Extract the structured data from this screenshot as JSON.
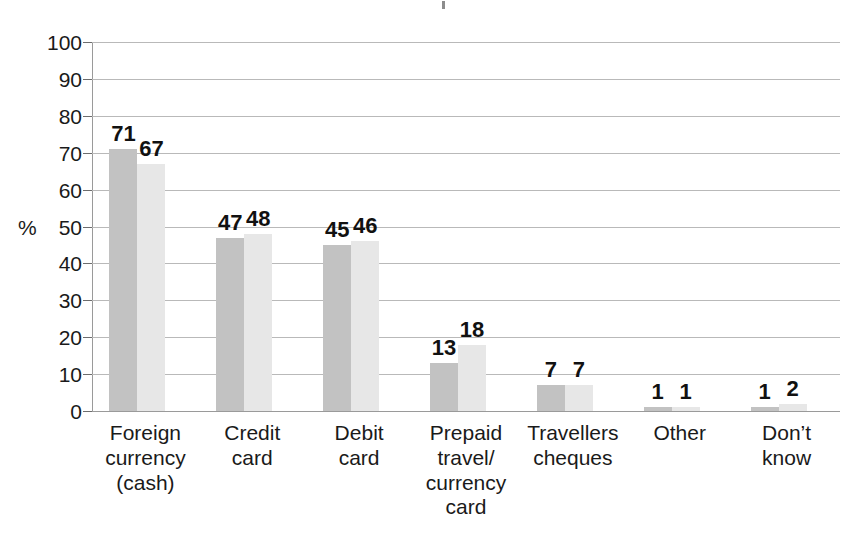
{
  "chart_data": {
    "type": "bar",
    "title": "",
    "xlabel": "",
    "ylabel": "%",
    "ylim": [
      0,
      100
    ],
    "ytick_step": 10,
    "yticks": [
      0,
      10,
      20,
      30,
      40,
      50,
      60,
      70,
      80,
      90,
      100
    ],
    "ytick_labels": [
      "0",
      "10",
      "20",
      "30",
      "40",
      "50",
      "60",
      "70",
      "80",
      "90",
      "100"
    ],
    "grid": true,
    "legend": "none",
    "categories": [
      "Foreign\ncurrency\n(cash)",
      "Credit\ncard",
      "Debit\ncard",
      "Prepaid\ntravel/\ncurrency\ncard",
      "Travellers\ncheques",
      "Other",
      "Don’t\nknow"
    ],
    "series": [
      {
        "name": "series-1",
        "color": "#c2c2c2",
        "values": [
          71,
          47,
          45,
          13,
          7,
          1,
          1
        ],
        "value_labels": [
          "71",
          "47",
          "45",
          "13",
          "7",
          "1",
          "1"
        ]
      },
      {
        "name": "series-2",
        "color": "#e7e7e7",
        "values": [
          67,
          48,
          46,
          18,
          7,
          1,
          2
        ],
        "value_labels": [
          "67",
          "48",
          "46",
          "18",
          "7",
          "1",
          "2"
        ]
      }
    ]
  }
}
